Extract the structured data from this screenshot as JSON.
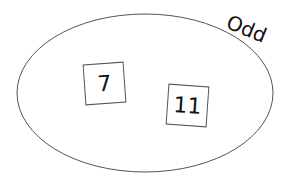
{
  "diagram": {
    "set": {
      "label": "Odd",
      "stroke_color": "#555555"
    },
    "elements": [
      {
        "value": "7"
      },
      {
        "value": "11"
      }
    ]
  }
}
